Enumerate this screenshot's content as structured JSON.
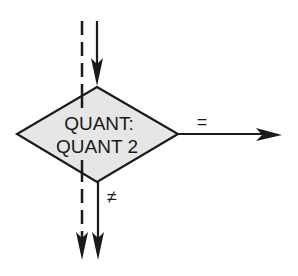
{
  "diagram": {
    "type": "flowchart-decision",
    "decision": {
      "line1": "QUANT:",
      "line2": "QUANT 2",
      "fill": "#e6e6e6",
      "stroke": "#1a1a1a"
    },
    "branches": {
      "equal": {
        "label": "=",
        "direction": "right"
      },
      "not_equal": {
        "label": "≠",
        "direction": "down"
      }
    },
    "flows": [
      {
        "name": "control-flow-in",
        "style": "solid",
        "direction": "down"
      },
      {
        "name": "bypass-flow",
        "style": "dashed",
        "direction": "down"
      }
    ],
    "colors": {
      "line": "#1a1a1a",
      "background": "#ffffff"
    }
  }
}
